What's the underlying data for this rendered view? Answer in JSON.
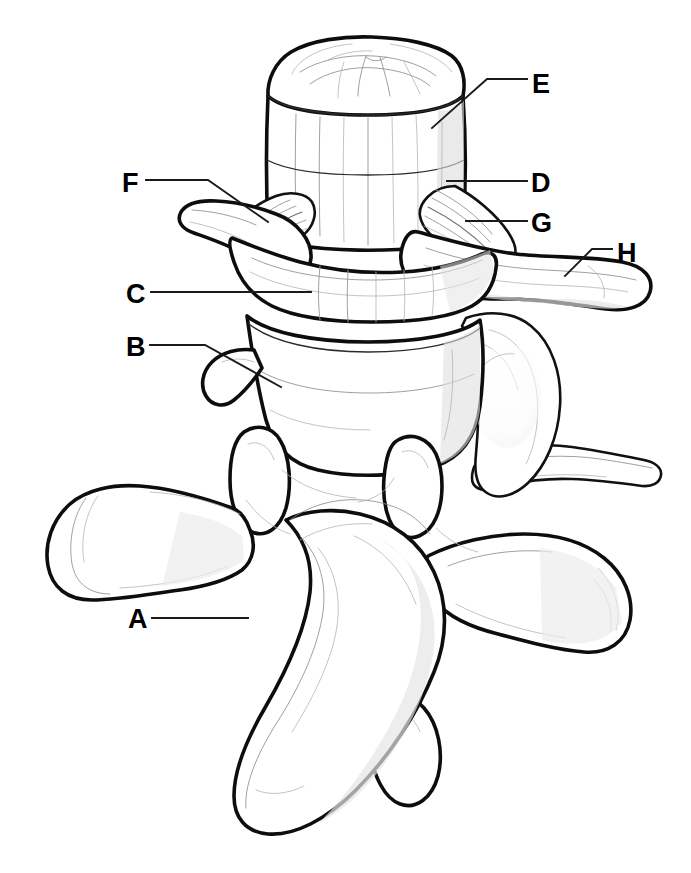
{
  "figure": {
    "style": "black-and-white line drawing",
    "background_color": "#ffffff",
    "line_color": "#0d0d0d",
    "label_color": "#000000",
    "canvas": {
      "width": 691,
      "height": 873
    }
  },
  "labels": [
    {
      "id": "A",
      "text": "A",
      "text_x": 128,
      "text_y": 628,
      "leader_path": "M 152 618 L 248 618",
      "region": "spinous-process"
    },
    {
      "id": "B",
      "text": "B",
      "text_x": 126,
      "text_y": 356,
      "leader_path": "M 150 345 L 205 345 L 281 387",
      "region": "lower-vertebral-body-margin"
    },
    {
      "id": "C",
      "text": "C",
      "text_x": 126,
      "text_y": 303,
      "leader_path": "M 151 292 L 311 292",
      "region": "anterior-longitudinal-ligament"
    },
    {
      "id": "D",
      "text": "D",
      "text_x": 531,
      "text_y": 192,
      "leader_path": "M 527 181 L 447 181",
      "region": "upper-vertebral-body"
    },
    {
      "id": "E",
      "text": "E",
      "text_x": 532,
      "text_y": 93,
      "leader_path": "M 527 79 L 487 79 L 432 128",
      "region": "intervertebral-disc"
    },
    {
      "id": "F",
      "text": "F",
      "text_x": 122,
      "text_y": 192,
      "leader_path": "M 146 180 L 208 180 L 268 222",
      "region": "costotransverse-ligament-fibers"
    },
    {
      "id": "G",
      "text": "G",
      "text_x": 531,
      "text_y": 232,
      "leader_path": "M 527 221 L 466 221",
      "region": "radiate-ligament"
    },
    {
      "id": "H",
      "text": "H",
      "text_x": 617,
      "text_y": 262,
      "leader_path": "M 612 249 L 592 249 L 565 276",
      "region": "rib-head-neck"
    }
  ],
  "structures": [
    {
      "name": "intervertebral-disc-top",
      "description": "cut superior surface of intervertebral disc at top of stack"
    },
    {
      "name": "upper-vertebral-body",
      "description": "cylindrical upper vertebral body below the disc"
    },
    {
      "name": "anterior-longitudinal-ligament",
      "description": "broad vertical ligament band running down the front of the bodies"
    },
    {
      "name": "ligament-fiber-fan-left",
      "description": "fanned ligament fibers radiating left toward the transverse process"
    },
    {
      "name": "ligament-fiber-fan-right",
      "description": "fanned ligament fibers radiating right toward the rib head"
    },
    {
      "name": "left-transverse-process-upper",
      "description": "upper left transverse process projecting left"
    },
    {
      "name": "right-rib-head",
      "description": "rib head and neck projecting to the right"
    },
    {
      "name": "lower-vertebral-body",
      "description": "lower vertebral body beneath the ligament band"
    },
    {
      "name": "left-transverse-process-lower",
      "description": "large lower left transverse process"
    },
    {
      "name": "right-transverse-process-lower",
      "description": "large lower right transverse process"
    },
    {
      "name": "superior-articular-processes",
      "description": "paired oval superior articular facets"
    },
    {
      "name": "spinous-process",
      "description": "long spinous process angled down and to the left"
    },
    {
      "name": "lower-right-rib",
      "description": "second rib segment on the lower right"
    }
  ]
}
